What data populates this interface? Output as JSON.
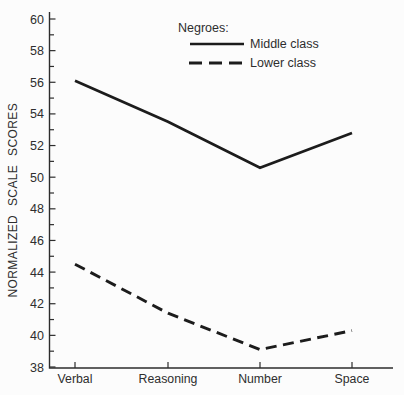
{
  "figure": {
    "background": "#fcfcfc",
    "ink_color": "#1c1c1c",
    "text_color": "#2e2e2e"
  },
  "chart_data": {
    "type": "line",
    "title": "",
    "xlabel": "",
    "ylabel": "NORMALIZED SCALE SCORES",
    "categories": [
      "Verbal",
      "Reasoning",
      "Number",
      "Space"
    ],
    "series": [
      {
        "name": "Middle class",
        "style": "solid",
        "values": [
          56.1,
          53.5,
          50.6,
          52.8
        ]
      },
      {
        "name": "Lower class",
        "style": "dashed",
        "values": [
          44.5,
          41.4,
          39.1,
          40.3
        ]
      }
    ],
    "legend": {
      "title": "Negroes:",
      "position": "top-center"
    },
    "ylim": [
      38,
      60
    ],
    "ytick_label_step": 2,
    "ytick_minor_step": 1,
    "ytick_labels": [
      "60",
      "58",
      "56",
      "54",
      "52",
      "50",
      "48",
      "46",
      "44",
      "42",
      "40",
      "38"
    ],
    "grid": false
  }
}
